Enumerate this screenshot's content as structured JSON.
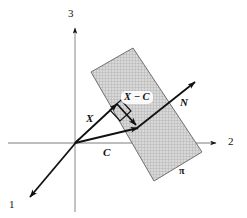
{
  "figure": {
    "background_color": "#ffffff",
    "stroke_color": "#111111",
    "plane": {
      "name": "pi",
      "label": "π",
      "fill_color": "#d3d3d3",
      "hatch_color": "#9a9a9a",
      "border_color": "#6f6f6f",
      "corners": [
        {
          "x": 91,
          "y": 72
        },
        {
          "x": 133,
          "y": 48
        },
        {
          "x": 202,
          "y": 152
        },
        {
          "x": 154,
          "y": 181
        }
      ]
    },
    "axes": [
      {
        "name": "axis-1",
        "label": "1",
        "label_x": 9,
        "label_y": 199,
        "x1": 75,
        "y1": 143,
        "x2": 27,
        "y2": 200
      },
      {
        "name": "axis-2",
        "label": "2",
        "label_x": 228,
        "label_y": 136,
        "x1": 8,
        "y1": 143,
        "x2": 219,
        "y2": 143
      },
      {
        "name": "axis-3",
        "label": "3",
        "label_x": 68,
        "label_y": 8,
        "x1": 75,
        "y1": 210,
        "x2": 75,
        "y2": 26
      }
    ],
    "vectors": [
      {
        "name": "vector-x",
        "label": "X",
        "label_x": 86,
        "label_y": 113,
        "x1": 75,
        "y1": 143,
        "x2": 117,
        "y2": 103
      },
      {
        "name": "vector-c",
        "label": "C",
        "label_x": 103,
        "label_y": 147,
        "x1": 75,
        "y1": 143,
        "x2": 138,
        "y2": 127
      },
      {
        "name": "vector-x-minus-c",
        "label": "X − C",
        "label_x": 123,
        "label_y": 93,
        "x1": 117,
        "y1": 103,
        "x2": 138,
        "y2": 127
      },
      {
        "name": "vector-n",
        "label": "N",
        "label_x": 180,
        "label_y": 97,
        "x1": 137,
        "y1": 128,
        "x2": 196,
        "y2": 81
      }
    ],
    "right_angle_marker": {
      "name": "right-angle-marker",
      "points": "111,109 122,99 132,110 121,120"
    }
  }
}
